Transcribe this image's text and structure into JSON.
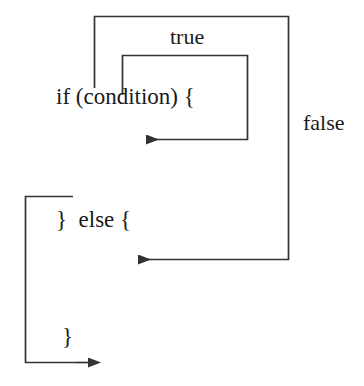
{
  "diagram": {
    "type": "flowchart",
    "background_color": "#ffffff",
    "stroke_color": "#333333",
    "text_color": "#1a1a1a",
    "code_labels": {
      "if_statement": "if (condition) {",
      "else_statement": "}  else {",
      "closing_brace": "}"
    },
    "edge_labels": {
      "true_branch": "true",
      "false_branch": "false"
    },
    "edges": [
      {
        "name": "true-branch-edge",
        "label": "true",
        "description": "From above if-statement, up and over to the right, back down and left into the if-body",
        "arrowhead": "left"
      },
      {
        "name": "false-branch-edge",
        "label": "false",
        "description": "From above if-statement, up and right down the far right side, then left into the else-body",
        "arrowhead": "left"
      },
      {
        "name": "exit-edge",
        "label": "",
        "description": "From the else-body left, down the left side and right out the bottom",
        "arrowhead": "right"
      }
    ]
  }
}
